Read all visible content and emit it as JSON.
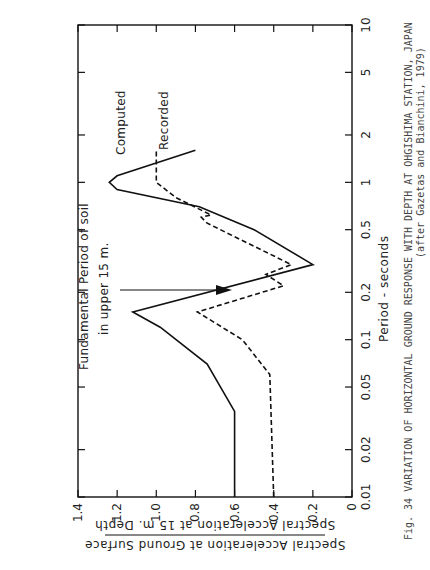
{
  "figure": {
    "caption_line1": "Fig. 34  VARIATION OF HORIZONTAL GROUND RESPONSE WITH DEPTH AT OHGISHIMA STATION, JAPAN",
    "caption_line2": "(after Gazetas and Bianchini, 1979)"
  },
  "annotations": {
    "arrow_label_line1": "Fundamental Period of soil",
    "arrow_label_line2": "in upper 15 m.",
    "computed_label": "Computed",
    "recorded_label": "Recorded"
  },
  "chart_data": {
    "type": "line",
    "title": "Variation of horizontal ground response with depth at Ohgishima Station, Japan",
    "xlabel": "Period - seconds",
    "ylabel": "Spectral Acceleration at 15 m. Depth / Spectral Acceleration at Ground Surface",
    "xscale": "log",
    "xlim": [
      0.01,
      10
    ],
    "ylim": [
      0,
      1.4
    ],
    "xticks": [
      "0.01",
      "0.02",
      "0.05",
      "0.1",
      "0.2",
      "0.5",
      "1",
      "2",
      "5",
      "10"
    ],
    "yticks": [
      "0",
      "0.2",
      "0.4",
      "0.6",
      "0.8",
      "1.0",
      "1.2",
      "1.4"
    ],
    "grid": false,
    "legend": "inline labels",
    "series": [
      {
        "name": "Recorded",
        "style": "solid",
        "points": [
          [
            0.01,
            0.6
          ],
          [
            0.03,
            0.6
          ],
          [
            0.035,
            0.6
          ],
          [
            0.07,
            0.74
          ],
          [
            0.12,
            0.98
          ],
          [
            0.15,
            1.12
          ],
          [
            0.3,
            0.2
          ],
          [
            0.5,
            0.5
          ],
          [
            0.7,
            0.78
          ],
          [
            0.9,
            1.2
          ],
          [
            1.0,
            1.24
          ],
          [
            1.1,
            1.2
          ],
          [
            1.6,
            0.8
          ]
        ]
      },
      {
        "name": "Computed",
        "style": "dashed",
        "points": [
          [
            0.01,
            0.4
          ],
          [
            0.06,
            0.42
          ],
          [
            0.1,
            0.56
          ],
          [
            0.15,
            0.79
          ],
          [
            0.22,
            0.35
          ],
          [
            0.26,
            0.44
          ],
          [
            0.3,
            0.31
          ],
          [
            0.55,
            0.74
          ],
          [
            0.6,
            0.77
          ],
          [
            0.62,
            0.72
          ],
          [
            0.8,
            0.9
          ],
          [
            1.0,
            1.0
          ],
          [
            1.6,
            1.0
          ]
        ]
      }
    ],
    "annotations": [
      {
        "text": "Fundamental Period of soil in upper 15 m.",
        "arrow_to_period": 0.3
      }
    ]
  }
}
